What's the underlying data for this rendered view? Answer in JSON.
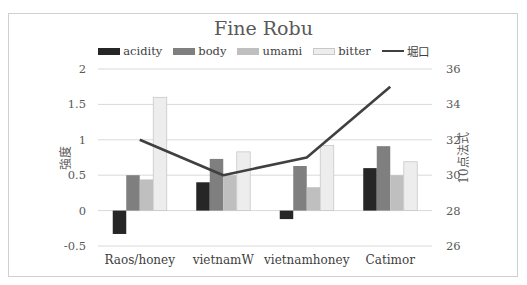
{
  "chart_data": {
    "type": "bar",
    "title": "Fine Robu",
    "categories": [
      "Raos/honey",
      "vietnamW",
      "vietnamhoney",
      "Catimor"
    ],
    "series": [
      {
        "name": "acidity",
        "axis": "left",
        "type": "bar",
        "color": "#262626",
        "values": [
          -0.33,
          0.4,
          -0.12,
          0.6
        ]
      },
      {
        "name": "body",
        "axis": "left",
        "type": "bar",
        "color": "#7f7f7f",
        "values": [
          0.5,
          0.73,
          0.63,
          0.91
        ]
      },
      {
        "name": "umami",
        "axis": "left",
        "type": "bar",
        "color": "#bfbfbf",
        "values": [
          0.44,
          0.5,
          0.33,
          0.5
        ]
      },
      {
        "name": "bitter",
        "axis": "left",
        "type": "bar",
        "color": "#ededed",
        "values": [
          1.6,
          0.83,
          0.92,
          0.69
        ]
      },
      {
        "name": "堀口",
        "axis": "right",
        "type": "line",
        "color": "#404040",
        "values": [
          32,
          30,
          31,
          35
        ]
      }
    ],
    "xlabel": "",
    "ylabel": "強度",
    "y2label": "10点法式",
    "ylim": [
      -0.5,
      2
    ],
    "y2lim": [
      26,
      36
    ],
    "yticks": [
      "2",
      "1.5",
      "1",
      "0.5",
      "0",
      "-0.5"
    ],
    "y2ticks": [
      "36",
      "34",
      "32",
      "30",
      "28",
      "26"
    ],
    "grid": true,
    "legend_position": "top"
  }
}
